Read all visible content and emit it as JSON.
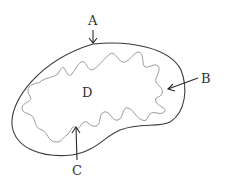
{
  "diagram": {
    "type": "cell-organelle",
    "labels": {
      "A": "A",
      "B": "B",
      "C": "C",
      "D": "D"
    },
    "parts": [
      {
        "id": "A",
        "description": "outer smooth membrane, arrow from top"
      },
      {
        "id": "B",
        "description": "space between membranes, arrow from right"
      },
      {
        "id": "C",
        "description": "inner folded membrane, arrow from bottom"
      },
      {
        "id": "D",
        "description": "inner matrix region"
      }
    ],
    "colors": {
      "outer_membrane": "#3a3a3a",
      "inner_membrane": "#9a9a9a",
      "arrow": "#2a2a2a",
      "label": "#333333",
      "background": "#ffffff"
    }
  }
}
